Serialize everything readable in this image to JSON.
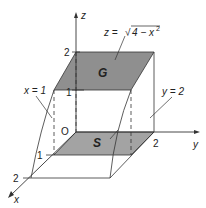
{
  "diagram": {
    "axes": {
      "x_label": "x",
      "y_label": "y",
      "z_label": "z",
      "origin_label": "O"
    },
    "ticks": {
      "z_2": "2",
      "z_1": "1",
      "x_1": "1",
      "x_2": "2",
      "y_2": "2"
    },
    "surface_label": "z = √4 − x²",
    "surface_eq_lhs": "z = ",
    "surface_eq_rad": "4 − x",
    "surface_eq_exp": "2",
    "plane_x_label": "x = 1",
    "plane_y_label": "y = 2",
    "region_top_label": "G",
    "region_base_label": "S",
    "colors": {
      "shade_top": "#8c8c8c",
      "shade_base": "#a0a0a0",
      "line": "#333333"
    }
  }
}
